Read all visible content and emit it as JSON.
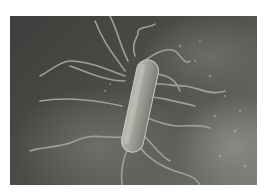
{
  "image": {
    "subject": "rod-shaped bacterium with flagella on a textured surface",
    "palette": {
      "background_dark": "#3e3e3c",
      "background_light": "#8a8a84",
      "cell_body": "#9a9a94",
      "cell_highlight": "#c8c8c0",
      "flagella": "#9c9c96",
      "border": "#ffffff"
    }
  }
}
